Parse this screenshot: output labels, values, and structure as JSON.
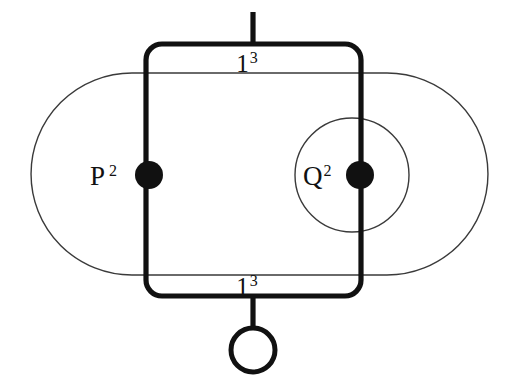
{
  "diagram": {
    "type": "knot-graph-diagram",
    "background_color": "#ffffff",
    "thick_line_color": "#111111",
    "thin_line_color": "#3a3a3a",
    "nodes": [
      {
        "id": "p-node",
        "label_base": "P",
        "label_exponent": "2",
        "style": "filled",
        "cx": 149,
        "cy": 175,
        "r": 14
      },
      {
        "id": "q-node",
        "label_base": "Q",
        "label_exponent": "2",
        "style": "filled",
        "cx": 360,
        "cy": 175,
        "r": 14
      },
      {
        "id": "open-node",
        "label_base": "",
        "label_exponent": "",
        "style": "open",
        "cx": 253,
        "cy": 350,
        "r": 22
      }
    ],
    "edge_labels": [
      {
        "id": "top-edge-label",
        "base": "1",
        "exponent": "3"
      },
      {
        "id": "bottom-edge-label",
        "base": "1",
        "exponent": "3"
      }
    ],
    "shapes": {
      "outer_stadium": {
        "name": "outer-stadium-outline",
        "left": 31,
        "right": 488,
        "top": 73,
        "bottom": 275
      },
      "inner_circle": {
        "name": "inner-circle-outline",
        "cx": 352,
        "cy": 175,
        "r": 57
      },
      "thick_rect": {
        "name": "thick-rounded-rectangle",
        "left": 146,
        "right": 361,
        "top": 44,
        "bottom": 296,
        "corner_radius": 16
      },
      "top_stem": {
        "name": "top-stem",
        "x": 253,
        "y_top": 12,
        "y_bottom": 44
      },
      "bottom_stem": {
        "name": "bottom-stem",
        "x": 253,
        "y_top": 296,
        "y_bottom": 328
      }
    }
  }
}
